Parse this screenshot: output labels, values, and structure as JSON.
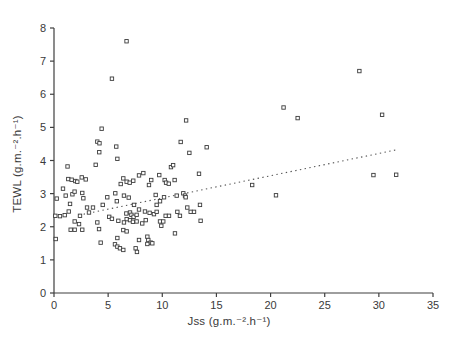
{
  "figure": {
    "background": "#ffffff",
    "axis_color": "#3f3f3f",
    "text_color": "#3a3a3a",
    "marker_color": "#3b3b3b",
    "trend_color": "#555555"
  },
  "chart_data": {
    "type": "scatter",
    "title": "",
    "xlabel": "Jss (g.m.⁻².h⁻¹)",
    "ylabel": "TEWL (g.m.⁻².h⁻¹)",
    "xlim": [
      0,
      35
    ],
    "ylim": [
      0,
      8
    ],
    "x_ticks": [
      0,
      5,
      10,
      15,
      20,
      25,
      30,
      35
    ],
    "y_ticks": [
      0,
      1,
      2,
      3,
      4,
      5,
      6,
      7,
      8
    ],
    "grid": false,
    "legend": "none",
    "marker": "open-square",
    "points": [
      [
        6.7,
        7.6
      ],
      [
        5.35,
        6.47
      ],
      [
        28.2,
        6.7
      ],
      [
        21.2,
        5.6
      ],
      [
        22.5,
        5.28
      ],
      [
        30.3,
        5.38
      ],
      [
        12.2,
        5.21
      ],
      [
        4.4,
        4.96
      ],
      [
        11.7,
        4.56
      ],
      [
        4.0,
        4.57
      ],
      [
        4.2,
        4.52
      ],
      [
        5.75,
        4.42
      ],
      [
        14.1,
        4.4
      ],
      [
        12.5,
        4.23
      ],
      [
        4.18,
        4.25
      ],
      [
        5.85,
        4.05
      ],
      [
        1.25,
        3.82
      ],
      [
        3.85,
        3.87
      ],
      [
        10.8,
        3.8
      ],
      [
        11.0,
        3.86
      ],
      [
        8.25,
        3.62
      ],
      [
        7.85,
        3.55
      ],
      [
        9.72,
        3.56
      ],
      [
        13.39,
        3.6
      ],
      [
        8.98,
        3.41
      ],
      [
        10.22,
        3.41
      ],
      [
        10.35,
        3.33
      ],
      [
        10.6,
        3.3
      ],
      [
        6.4,
        3.46
      ],
      [
        6.71,
        3.36
      ],
      [
        6.99,
        3.33
      ],
      [
        7.32,
        3.39
      ],
      [
        6.16,
        3.29
      ],
      [
        8.77,
        3.26
      ],
      [
        11.14,
        3.41
      ],
      [
        1.32,
        3.44
      ],
      [
        1.63,
        3.42
      ],
      [
        1.97,
        3.38
      ],
      [
        2.15,
        3.36
      ],
      [
        2.56,
        3.49
      ],
      [
        2.93,
        3.43
      ],
      [
        29.5,
        3.56
      ],
      [
        31.6,
        3.57
      ],
      [
        0.83,
        3.15
      ],
      [
        1.7,
        2.98
      ],
      [
        1.9,
        3.06
      ],
      [
        2.61,
        3.02
      ],
      [
        4.92,
        2.89
      ],
      [
        0.25,
        2.85
      ],
      [
        1.48,
        2.69
      ],
      [
        1.08,
        2.94
      ],
      [
        2.71,
        2.86
      ],
      [
        3.05,
        2.58
      ],
      [
        3.6,
        2.58
      ],
      [
        4.5,
        2.66
      ],
      [
        5.66,
        3.01
      ],
      [
        5.8,
        2.77
      ],
      [
        6.46,
        2.94
      ],
      [
        6.9,
        2.88
      ],
      [
        9.39,
        2.96
      ],
      [
        10.16,
        2.89
      ],
      [
        9.79,
        2.77
      ],
      [
        7.39,
        2.66
      ],
      [
        9.48,
        2.66
      ],
      [
        7.85,
        2.52
      ],
      [
        11.94,
        3.01
      ],
      [
        12.1,
        2.94
      ],
      [
        12.16,
        2.89
      ],
      [
        11.33,
        2.94
      ],
      [
        13.48,
        2.66
      ],
      [
        12.31,
        2.58
      ],
      [
        18.3,
        3.26
      ],
      [
        20.5,
        2.95
      ],
      [
        1.36,
        2.46
      ],
      [
        0.12,
        2.33
      ],
      [
        0.55,
        2.32
      ],
      [
        0.99,
        2.35
      ],
      [
        2.4,
        2.33
      ],
      [
        3.23,
        2.43
      ],
      [
        5.1,
        2.3
      ],
      [
        5.35,
        2.24
      ],
      [
        1.91,
        2.16
      ],
      [
        2.31,
        2.08
      ],
      [
        4.0,
        2.13
      ],
      [
        6.68,
        2.4
      ],
      [
        7.02,
        2.43
      ],
      [
        7.15,
        2.36
      ],
      [
        7.35,
        2.3
      ],
      [
        7.63,
        2.36
      ],
      [
        8.4,
        2.46
      ],
      [
        8.83,
        2.42
      ],
      [
        9.23,
        2.38
      ],
      [
        9.48,
        2.45
      ],
      [
        10.31,
        2.33
      ],
      [
        10.62,
        2.33
      ],
      [
        6.71,
        2.23
      ],
      [
        7.02,
        2.2
      ],
      [
        6.46,
        2.13
      ],
      [
        5.94,
        2.18
      ],
      [
        7.29,
        2.15
      ],
      [
        7.63,
        2.16
      ],
      [
        8.15,
        2.1
      ],
      [
        8.47,
        2.2
      ],
      [
        9.79,
        2.16
      ],
      [
        10.09,
        2.16
      ],
      [
        9.91,
        2.03
      ],
      [
        11.39,
        2.45
      ],
      [
        12.62,
        2.45
      ],
      [
        12.93,
        2.45
      ],
      [
        11.63,
        2.33
      ],
      [
        13.54,
        2.18
      ],
      [
        1.54,
        1.91
      ],
      [
        1.91,
        1.91
      ],
      [
        2.61,
        1.91
      ],
      [
        4.16,
        1.93
      ],
      [
        0.16,
        1.63
      ],
      [
        4.31,
        1.52
      ],
      [
        6.4,
        1.9
      ],
      [
        6.71,
        1.86
      ],
      [
        5.85,
        1.66
      ],
      [
        7.85,
        1.6
      ],
      [
        8.62,
        1.7
      ],
      [
        8.71,
        1.6
      ],
      [
        8.93,
        1.52
      ],
      [
        8.62,
        1.48
      ],
      [
        9.08,
        1.5
      ],
      [
        5.63,
        1.47
      ],
      [
        11.17,
        1.8
      ],
      [
        5.85,
        1.4
      ],
      [
        6.09,
        1.35
      ],
      [
        7.54,
        1.35
      ],
      [
        6.4,
        1.3
      ],
      [
        7.66,
        1.24
      ]
    ],
    "trend_line": {
      "style": "dotted",
      "x_start": 2.3,
      "x_end": 31.6,
      "y_start": 2.35,
      "y_end": 4.32
    }
  }
}
